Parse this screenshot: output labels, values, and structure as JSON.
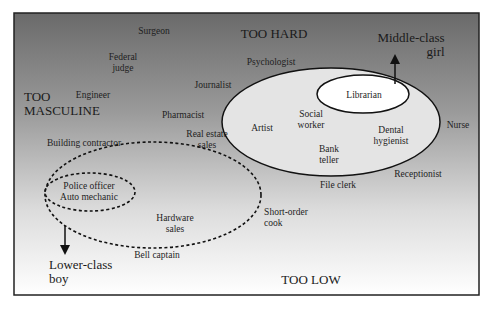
{
  "diagram": {
    "frame": {
      "x": 14,
      "y": 13,
      "width": 465,
      "height": 282,
      "gradient_top": "#6a6a6a",
      "gradient_bottom": "#ffffff",
      "border": "#222222"
    },
    "region_labels": {
      "too_hard": "TOO HARD",
      "too_masculine": "TOO\nMASCULINE",
      "too_low": "TOO LOW"
    },
    "arrows": {
      "middle_class_girl": "Middle-class\ngirl",
      "lower_class_boy": "Lower-class\nboy"
    },
    "occupations": [
      {
        "id": "surgeon",
        "label": "Surgeon",
        "x": 154,
        "y": 31
      },
      {
        "id": "federal-judge",
        "label": "Federal\njudge",
        "x": 123,
        "y": 63
      },
      {
        "id": "engineer",
        "label": "Engineer",
        "x": 93,
        "y": 95
      },
      {
        "id": "journalist",
        "label": "Journalist",
        "x": 213,
        "y": 85
      },
      {
        "id": "psychologist",
        "label": "Psychologist",
        "x": 271,
        "y": 62
      },
      {
        "id": "pharmacist",
        "label": "Pharmacist",
        "x": 183,
        "y": 115
      },
      {
        "id": "real-estate-sales",
        "label": "Real estate\nsales",
        "x": 207,
        "y": 140
      },
      {
        "id": "building-contractor",
        "label": "Building contractor",
        "x": 84,
        "y": 143
      },
      {
        "id": "librarian",
        "label": "Librarian",
        "x": 364,
        "y": 95
      },
      {
        "id": "artist",
        "label": "Artist",
        "x": 262,
        "y": 128
      },
      {
        "id": "social-worker",
        "label": "Social\nworker",
        "x": 311,
        "y": 120
      },
      {
        "id": "bank-teller",
        "label": "Bank\nteller",
        "x": 329,
        "y": 155
      },
      {
        "id": "dental-hygienist",
        "label": "Dental\nhygienist",
        "x": 391,
        "y": 136
      },
      {
        "id": "nurse",
        "label": "Nurse",
        "x": 458,
        "y": 125
      },
      {
        "id": "receptionist",
        "label": "Receptionist",
        "x": 418,
        "y": 174
      },
      {
        "id": "file-clerk",
        "label": "File clerk",
        "x": 338,
        "y": 185
      },
      {
        "id": "police-officer",
        "label": "Police officer\nAuto mechanic",
        "x": 89,
        "y": 192
      },
      {
        "id": "short-order-cook",
        "label": "Short-order\ncook",
        "x": 286,
        "y": 218
      },
      {
        "id": "hardware-sales",
        "label": "Hardware\nsales",
        "x": 175,
        "y": 224
      },
      {
        "id": "bell-captain",
        "label": "Bell captain",
        "x": 157,
        "y": 255
      }
    ],
    "shapes": {
      "feminine_ellipse": {
        "cx": 331,
        "cy": 122,
        "rx": 109,
        "ry": 54,
        "fill": "#e2e2e2",
        "stroke": "solid"
      },
      "librarian_ellipse": {
        "cx": 363,
        "cy": 94,
        "rx": 46,
        "ry": 19,
        "fill": "#ffffff",
        "stroke": "solid"
      },
      "masculine_ellipse": {
        "cx": 153,
        "cy": 195,
        "rx": 108,
        "ry": 53,
        "stroke": "dashed"
      },
      "police_ellipse": {
        "cx": 90,
        "cy": 192,
        "rx": 45,
        "ry": 19,
        "stroke": "dashed"
      }
    }
  }
}
